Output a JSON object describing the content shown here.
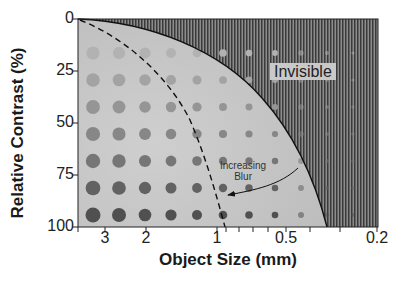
{
  "chart_data": {
    "type": "scatter",
    "title": "",
    "subtitle": "Contrast-detail diagram",
    "xlabel": "Object Size (mm)",
    "ylabel": "Relative Contrast (%)",
    "x_scale": "log (reversed)",
    "x_ticks_labeled": [
      "3",
      "2",
      "1",
      "0.5",
      "0.2"
    ],
    "x_minor_ticks": [
      0.9,
      0.8,
      0.7,
      0.6,
      0.4,
      0.3
    ],
    "y_ticks": [
      "0",
      "25",
      "50",
      "75",
      "100"
    ],
    "ylim": [
      0,
      100
    ],
    "y_inverted": true,
    "grid": false,
    "dot_grid": {
      "columns": 11,
      "rows": 7,
      "row_contrasts_pct": [
        12,
        27,
        41,
        55,
        69,
        83,
        97
      ],
      "note": "Dot diameter decreases left to right; dot darkness increases top to bottom"
    },
    "curves": [
      {
        "name": "Visibility threshold",
        "style": "solid",
        "description": "Boundary between visible region (lower-left) and Invisible region (upper-right)",
        "points": [
          [
            3.8,
            0
          ],
          [
            2,
            5
          ],
          [
            1,
            22
          ],
          [
            0.6,
            50
          ],
          [
            0.45,
            75
          ],
          [
            0.35,
            100
          ]
        ]
      },
      {
        "name": "Blurred threshold",
        "style": "dashed",
        "description": "Threshold shifted with increasing blur",
        "points": [
          [
            3.8,
            0
          ],
          [
            2.5,
            18
          ],
          [
            1.6,
            50
          ],
          [
            1.1,
            80
          ],
          [
            0.95,
            100
          ]
        ]
      }
    ],
    "annotations": [
      {
        "text": "Invisible",
        "region": "upper-right hatched area"
      },
      {
        "text": "Increasing Blur",
        "arrow": "from solid curve toward dashed curve at ~80% contrast"
      }
    ],
    "legend": null
  },
  "labels": {
    "invisible": "Invisible",
    "blur_line1": "Increasing",
    "blur_line2": "Blur",
    "xtitle": "Object Size (mm)",
    "ytitle": "Relative Contrast (%)",
    "yticks": [
      "0",
      "25",
      "50",
      "75",
      "100"
    ],
    "xticks": [
      "3",
      "2",
      "1",
      "0.5",
      "0.2"
    ]
  }
}
